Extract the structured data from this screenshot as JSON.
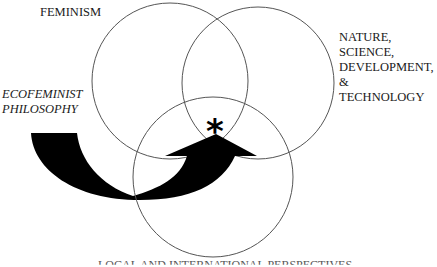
{
  "diagram": {
    "type": "venn",
    "circles": [
      {
        "id": "feminism",
        "label": "FEMINISM",
        "cx": 170,
        "cy": 81,
        "r": 78
      },
      {
        "id": "nature",
        "label_lines": [
          "NATURE,",
          "SCIENCE,",
          "DEVELOPMENT,",
          "& TECHNOLOGY"
        ],
        "cx": 258,
        "cy": 83,
        "r": 76
      },
      {
        "id": "local-global",
        "label": "LOCAL AND INTERNATIONAL PERSPECTIVES",
        "cx": 213,
        "cy": 177,
        "r": 80
      }
    ],
    "labels": {
      "feminism": "FEMINISM",
      "nature": [
        "NATURE,",
        "SCIENCE,",
        "DEVELOPMENT,",
        "& TECHNOLOGY"
      ],
      "ecofeminist": [
        "ECOFEMINIST",
        "PHILOSOPHY"
      ],
      "bottom": "LOCAL AND INTERNATIONAL PERSPECTIVES"
    },
    "center_mark": "*",
    "colors": {
      "stroke": "#555555",
      "arrow": "#000000",
      "text": "#1a1a1a"
    }
  }
}
